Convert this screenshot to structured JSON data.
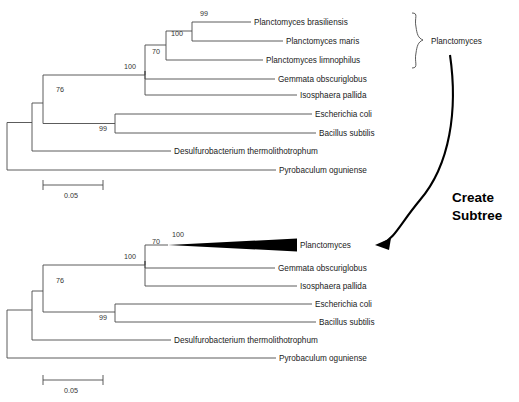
{
  "figure": {
    "action_label_line1": "Create",
    "action_label_line2": "Subtree",
    "clade_bracket_label": "Planctomyces",
    "colors": {
      "branch": "#4a4a4a",
      "text": "#1a1a1a",
      "arrow": "#000000",
      "collapsed_clade": "#000000",
      "background": "#ffffff"
    }
  },
  "top_tree": {
    "name": "full-tree",
    "scale": {
      "value": "0.05",
      "x1": 43,
      "x2": 103,
      "y": 185,
      "label_y": 197
    },
    "tips": [
      {
        "label": "Planctomyces brasiliensis",
        "y": 22,
        "tip_x": 251
      },
      {
        "label": "Planctomyces maris",
        "y": 41,
        "tip_x": 283
      },
      {
        "label": "Planctomyces limnophilus",
        "y": 60,
        "tip_x": 263
      },
      {
        "label": "Gemmata obscuriglobus",
        "y": 79,
        "tip_x": 275
      },
      {
        "label": "Isosphaera pallida",
        "y": 95,
        "tip_x": 297
      },
      {
        "label": "Escherichia coli",
        "y": 114,
        "tip_x": 312
      },
      {
        "label": "Bacillus subtilis",
        "y": 133,
        "tip_x": 316
      },
      {
        "label": "Desulfurobacterium thermolithotrophum",
        "y": 151,
        "tip_x": 171
      },
      {
        "label": "Pyrobaculum oguniense",
        "y": 170,
        "tip_x": 276
      }
    ],
    "bootstraps": [
      {
        "value": "99",
        "x": 200,
        "y": 16
      },
      {
        "value": "100",
        "x": 171,
        "y": 36
      },
      {
        "value": "70",
        "x": 155,
        "y": 54
      },
      {
        "value": "100",
        "x": 126,
        "y": 69
      },
      {
        "value": "76",
        "x": 58,
        "y": 92
      },
      {
        "value": "99",
        "x": 101,
        "y": 130
      }
    ]
  },
  "bottom_tree": {
    "name": "collapsed-tree",
    "scale": {
      "value": "0.05",
      "x1": 43,
      "x2": 103,
      "y": 380,
      "label_y": 392
    },
    "collapsed": {
      "label": "Planctomyces",
      "y": 245,
      "apex_x": 168,
      "base_x": 297,
      "half_height": 6.5
    },
    "tips": [
      {
        "label": "Gemmata obscuriglobus",
        "y": 268,
        "tip_x": 275
      },
      {
        "label": "Isosphaera pallida",
        "y": 286,
        "tip_x": 297
      },
      {
        "label": "Escherichia coli",
        "y": 304,
        "tip_x": 312
      },
      {
        "label": "Bacillus subtilis",
        "y": 322,
        "tip_x": 316
      },
      {
        "label": "Desulfurobacterium thermolithotrophum",
        "y": 340,
        "tip_x": 171
      },
      {
        "label": "Pyrobaculum oguniense",
        "y": 358,
        "tip_x": 276
      }
    ],
    "bootstraps": [
      {
        "value": "100",
        "x": 175,
        "y": 236
      },
      {
        "value": "70",
        "x": 155,
        "y": 249
      },
      {
        "value": "100",
        "x": 126,
        "y": 265
      },
      {
        "value": "76",
        "x": 58,
        "y": 285
      },
      {
        "value": "99",
        "x": 101,
        "y": 320
      }
    ]
  }
}
